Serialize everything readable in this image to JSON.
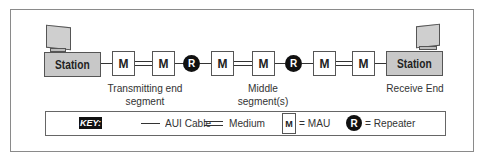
{
  "diagram": {
    "stations": [
      {
        "label": "Station",
        "role": "transmitting"
      },
      {
        "label": "Station",
        "role": "receiving"
      }
    ],
    "mau_label": "M",
    "repeater_label": "R",
    "chain": [
      "station",
      "aui",
      "M",
      "medium",
      "M",
      "aui",
      "R",
      "aui",
      "M",
      "medium",
      "M",
      "aui",
      "R",
      "aui",
      "M",
      "medium",
      "M",
      "aui",
      "station"
    ],
    "segment_labels": {
      "transmitting_line1": "Transmitting end",
      "transmitting_line2": "segment",
      "middle_line1": "Middle",
      "middle_line2": "segment(s)",
      "receive": "Receive End"
    }
  },
  "key": {
    "badge": "KEY:",
    "aui_cable": "AUI Cable",
    "medium": "Medium",
    "mau_symbol": "M",
    "mau": "= MAU",
    "repeater_symbol": "R",
    "repeater": "= Repeater"
  },
  "colors": {
    "station_fill": "#c8c8c8",
    "repeater_fill": "#111111",
    "line": "#333333",
    "border": "#8a8a8a"
  }
}
